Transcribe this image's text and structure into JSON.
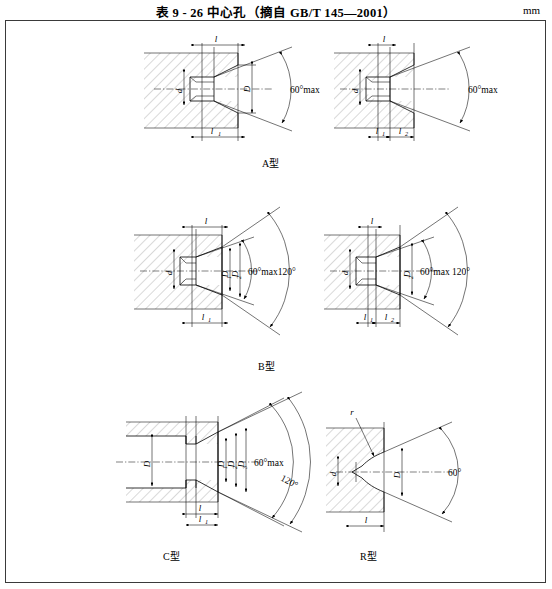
{
  "document": {
    "title": "表 9 - 26   中心孔（摘自 GB/T 145—2001）",
    "unit": "mm"
  },
  "figures": [
    {
      "id": "a-left",
      "caption": "",
      "type": "A",
      "dims": [
        "l",
        "l",
        "d",
        "D"
      ],
      "angle": "60°max",
      "labels": {
        "l_top": "l",
        "l_bottom": "l",
        "d": "d",
        "D": "D",
        "angle": "60°max"
      }
    },
    {
      "id": "a-right",
      "caption": "A型",
      "type": "A",
      "labels": {
        "l_top": "l",
        "l1": "l",
        "l2": "l",
        "d": "d",
        "angle": "60°max"
      }
    },
    {
      "id": "b-left",
      "caption": "",
      "type": "B",
      "labels": {
        "l_top": "l",
        "l1": "l",
        "d": "d",
        "D1": "D",
        "D2": "D",
        "angle": "60°max120°"
      }
    },
    {
      "id": "b-right",
      "caption": "B型",
      "type": "B",
      "labels": {
        "l_top": "l",
        "l1": "l",
        "l2": "l",
        "d": "d",
        "D2": "D",
        "angle": "60°max 120°"
      }
    },
    {
      "id": "c-left",
      "caption": "C型",
      "type": "C",
      "labels": {
        "D": "D",
        "D1": "D",
        "D2": "D",
        "D3": "D",
        "l": "l",
        "l1": "l",
        "angle_a": "60°max",
        "angle_b": "120°"
      }
    },
    {
      "id": "r-right",
      "caption": "R型",
      "type": "R",
      "labels": {
        "r": "r",
        "d": "d",
        "D": "D",
        "l": "l",
        "angle": "60°"
      }
    }
  ],
  "captions": {
    "a": "A型",
    "b": "B型",
    "c": "C型",
    "r": "R型"
  },
  "dimension_symbols": {
    "l": "l",
    "l1": "l",
    "l2": "l",
    "d": "d",
    "D": "D",
    "D1": "D",
    "D2": "D",
    "D3": "D",
    "r": "r",
    "sub1": "1",
    "sub2": "2",
    "sub3": "3"
  },
  "angles": {
    "a_left": "60°max",
    "a_right": "60°max",
    "b_left": "60°max120°",
    "b_right": "60°max 120°",
    "c_main": "60°max",
    "c_outer": "120°",
    "r_right": "60°"
  },
  "colors": {
    "ink": "#000000",
    "hatch": "#555555",
    "frame": "#3a3a3a",
    "paper": "#ffffff"
  }
}
